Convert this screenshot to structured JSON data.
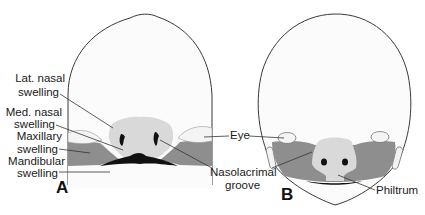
{
  "figure": {
    "panels": [
      {
        "id": "A",
        "letter": "A",
        "labels": {
          "lat_nasal_1": "Lat. nasal",
          "lat_nasal_2": "swelling",
          "med_nasal_1": "Med. nasal",
          "med_nasal_2": "swelling",
          "maxillary_1": "Maxillary",
          "maxillary_2": "swelling",
          "mandibular_1": "Mandibular",
          "mandibular_2": "swelling"
        }
      },
      {
        "id": "B",
        "letter": "B",
        "labels": {
          "philtrum": "Philtrum"
        }
      }
    ],
    "shared_labels": {
      "eye": "Eye",
      "nasolacrimal_1": "Nasolacrimal",
      "nasolacrimal_2": "groove"
    },
    "colors": {
      "head_fill": "#fbfbfb",
      "outline": "#3a3a3a",
      "nasal_swelling": "#d9d9d9",
      "maxillary": "#8e8e8e",
      "mouth": "#111111",
      "eye": "#f4f4f4"
    }
  }
}
